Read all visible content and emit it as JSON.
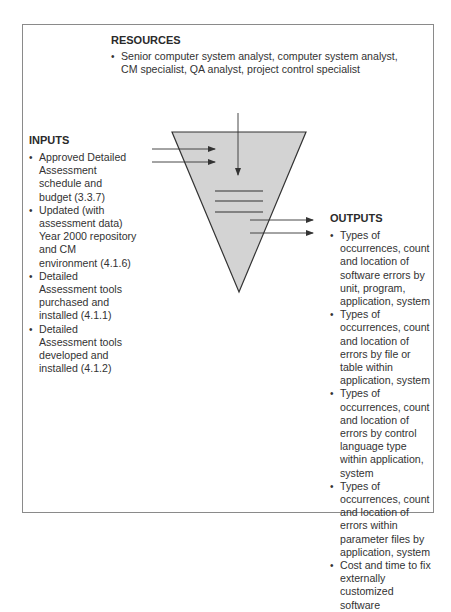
{
  "resources": {
    "heading": "RESOURCES",
    "items": [
      "Senior computer system analyst, computer system analyst, CM specialist, QA analyst, project control specialist"
    ]
  },
  "inputs": {
    "heading": "INPUTS",
    "items": [
      "Approved Detailed Assessment schedule and budget (3.3.7)",
      "Updated (with assessment data) Year 2000 repository and CM environment (4.1.6)",
      "Detailed Assessment tools purchased and installed (4.1.1)",
      "Detailed Assessment tools developed and installed (4.1.2)"
    ]
  },
  "outputs": {
    "heading": "OUTPUTS",
    "items": [
      "Types of occurrences, count and location of software errors by unit, program, application, system",
      "Types of occurrences, count and location of errors by file or table within application, system",
      "Types of occurrences, count and location of errors by control language type within application, system",
      "Types of occurrences, count and location of errors within parameter files by application, system",
      "Cost and time to fix externally customized software"
    ]
  },
  "colors": {
    "funnel_fill": "#d3d3d3",
    "line": "#333333",
    "frame": "#8a8a8a"
  }
}
